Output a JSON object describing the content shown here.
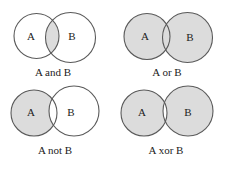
{
  "figure": {
    "fill_color": "#dcdcdc",
    "stroke_color": "#5a5a5a",
    "panels": [
      {
        "id": "and",
        "caption": "A and B",
        "operation": "intersection",
        "set_a_label": "A",
        "set_b_label": "B",
        "circle_a": {
          "cx": 36.5,
          "cy": 36,
          "r": 22.5
        },
        "circle_b": {
          "cx": 70.5,
          "cy": 37.5,
          "r": 25
        },
        "label_a_pos": {
          "x": 31,
          "y": 37
        },
        "label_b_pos": {
          "x": 72,
          "y": 37
        },
        "caption_pos": {
          "x": 53,
          "y": 76
        }
      },
      {
        "id": "or",
        "caption": "A or B",
        "operation": "union",
        "set_a_label": "A",
        "set_b_label": "B",
        "circle_a": {
          "cx": 147,
          "cy": 36.5,
          "r": 23
        },
        "circle_b": {
          "cx": 187.5,
          "cy": 37.5,
          "r": 25
        },
        "label_a_pos": {
          "x": 145,
          "y": 37
        },
        "label_b_pos": {
          "x": 190,
          "y": 38
        },
        "caption_pos": {
          "x": 167,
          "y": 76
        }
      },
      {
        "id": "not",
        "caption": "A not B",
        "operation": "difference",
        "set_a_label": "A",
        "set_b_label": "B",
        "circle_a": {
          "cx": 34,
          "cy": 113,
          "r": 23
        },
        "circle_b": {
          "cx": 74,
          "cy": 111,
          "r": 25
        },
        "label_a_pos": {
          "x": 31,
          "y": 113
        },
        "label_b_pos": {
          "x": 71,
          "y": 113
        },
        "caption_pos": {
          "x": 55,
          "y": 154
        }
      },
      {
        "id": "xor",
        "caption": "A xor B",
        "operation": "symmetric-difference",
        "set_a_label": "A",
        "set_b_label": "B",
        "circle_a": {
          "cx": 144,
          "cy": 113,
          "r": 23
        },
        "circle_b": {
          "cx": 188,
          "cy": 111,
          "r": 25
        },
        "label_a_pos": {
          "x": 142,
          "y": 113
        },
        "label_b_pos": {
          "x": 188,
          "y": 113
        },
        "caption_pos": {
          "x": 166,
          "y": 154
        }
      }
    ]
  }
}
